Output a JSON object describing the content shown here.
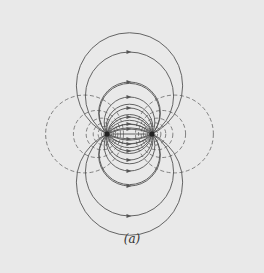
{
  "figure": {
    "caption": "(a)",
    "charges": [
      {
        "x": 107,
        "y": 134,
        "label": "source"
      },
      {
        "x": 152,
        "y": 134,
        "label": "sink"
      }
    ],
    "field_line_offsets": [
      82,
      52,
      37,
      26,
      17,
      10,
      5
    ],
    "equipotential_params": [
      0.55,
      0.85,
      1.15,
      1.45,
      1.8,
      2.2,
      2.7
    ],
    "colors": {
      "background": "#e9e9e9",
      "field_line": "#555555",
      "equipotential": "#666666",
      "charge": "#222222"
    }
  }
}
